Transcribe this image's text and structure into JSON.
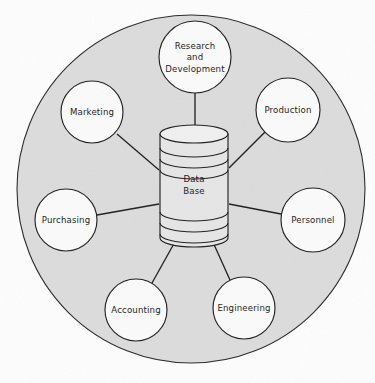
{
  "diagram": {
    "type": "hub-and-spoke",
    "background_color": "#fdfdfd",
    "outer_circle": {
      "name": "organization-boundary",
      "fill_color": "#dcdcdc",
      "stroke_color": "#2a2a2a",
      "cx": 191,
      "cy": 189,
      "r": 174
    },
    "hub": {
      "name": "data-base-cylinder",
      "label_line_1": "Data",
      "label_line_2": "Base",
      "fill_color": "#e6e6e6",
      "stroke_color": "#1f1f1f",
      "cx": 194,
      "top_y": 134,
      "bottom_y": 238,
      "half_width": 34,
      "ellipse_ry": 9,
      "ring_offsets": [
        14,
        25,
        36,
        78,
        89,
        100
      ]
    },
    "nodes": [
      {
        "name": "node-research-and-development",
        "label": "Research and Development",
        "lines": [
          "Research",
          "and",
          "Development"
        ],
        "cx": 195,
        "cy": 57,
        "r": 36,
        "fill_color": "#fbfbfb",
        "stroke_color": "#1f1f1f"
      },
      {
        "name": "node-production",
        "label": "Production",
        "lines": [
          "Production"
        ],
        "cx": 288,
        "cy": 110,
        "r": 32,
        "fill_color": "#fbfbfb",
        "stroke_color": "#1f1f1f"
      },
      {
        "name": "node-personnel",
        "label": "Personnel",
        "lines": [
          "Personnel"
        ],
        "cx": 313,
        "cy": 220,
        "r": 32,
        "fill_color": "#fbfbfb",
        "stroke_color": "#1f1f1f"
      },
      {
        "name": "node-engineering",
        "label": "Engineering",
        "lines": [
          "Engineering"
        ],
        "cx": 244,
        "cy": 308,
        "r": 31,
        "fill_color": "#fbfbfb",
        "stroke_color": "#1f1f1f"
      },
      {
        "name": "node-accounting",
        "label": "Accounting",
        "lines": [
          "Accounting"
        ],
        "cx": 136,
        "cy": 310,
        "r": 31,
        "fill_color": "#fbfbfb",
        "stroke_color": "#1f1f1f"
      },
      {
        "name": "node-purchasing",
        "label": "Purchasing",
        "lines": [
          "Purchasing"
        ],
        "cx": 66,
        "cy": 220,
        "r": 31,
        "fill_color": "#fbfbfb",
        "stroke_color": "#1f1f1f"
      },
      {
        "name": "node-marketing",
        "label": "Marketing",
        "lines": [
          "Marketing"
        ],
        "cx": 92,
        "cy": 112,
        "r": 31,
        "fill_color": "#fbfbfb",
        "stroke_color": "#1f1f1f"
      }
    ],
    "connectors": [
      {
        "name": "spoke-research-and-development",
        "from": "node-research-and-development",
        "to": "data-base-cylinder",
        "x1": 195,
        "y1": 93,
        "x2": 195,
        "y2": 134
      },
      {
        "name": "spoke-production",
        "from": "node-production",
        "to": "data-base-cylinder",
        "x1": 265,
        "y1": 132,
        "x2": 229,
        "y2": 168
      },
      {
        "name": "spoke-personnel",
        "from": "node-personnel",
        "to": "data-base-cylinder",
        "x1": 281,
        "y1": 214,
        "x2": 229,
        "y2": 204
      },
      {
        "name": "spoke-engineering",
        "from": "node-engineering",
        "to": "data-base-cylinder",
        "x1": 230,
        "y1": 280,
        "x2": 212,
        "y2": 240
      },
      {
        "name": "spoke-accounting",
        "from": "node-accounting",
        "to": "data-base-cylinder",
        "x1": 152,
        "y1": 283,
        "x2": 176,
        "y2": 240
      },
      {
        "name": "spoke-purchasing",
        "from": "node-purchasing",
        "to": "data-base-cylinder",
        "x1": 97,
        "y1": 215,
        "x2": 159,
        "y2": 204
      },
      {
        "name": "spoke-marketing",
        "from": "node-marketing",
        "to": "data-base-cylinder",
        "x1": 117,
        "y1": 134,
        "x2": 159,
        "y2": 170
      }
    ]
  }
}
